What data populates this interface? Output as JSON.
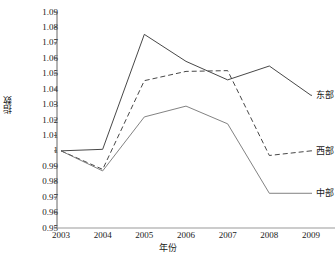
{
  "chart_data": {
    "type": "line",
    "title": "",
    "xlabel": "年份",
    "ylabel": "指数",
    "x": [
      2003,
      2004,
      2005,
      2006,
      2007,
      2008,
      2009
    ],
    "xtick_labels": [
      "2003",
      "2004",
      "2005",
      "2006",
      "2007",
      "2008",
      "2009"
    ],
    "ytick_labels": [
      "1.09",
      "1.08",
      "1.07",
      "1.06",
      "1.05",
      "1.04",
      "1.03",
      "1.02",
      "1.01",
      "1",
      "0.99",
      "0.98",
      "0.97",
      "0.96",
      "0.95"
    ],
    "ytick_values": [
      1.09,
      1.08,
      1.07,
      1.06,
      1.05,
      1.04,
      1.03,
      1.02,
      1.01,
      1.0,
      0.99,
      0.98,
      0.97,
      0.96,
      0.95
    ],
    "ylim": [
      0.95,
      1.09
    ],
    "xlim": [
      2003,
      2009
    ],
    "grid": false,
    "legend_position": "right-inline",
    "series": [
      {
        "name": "东部",
        "style": "solid",
        "color": "#3d3d3d",
        "values": [
          1.0,
          1.001,
          1.0755,
          1.058,
          1.046,
          1.055,
          1.036
        ]
      },
      {
        "name": "西部",
        "style": "dashed",
        "color": "#3d3d3d",
        "values": [
          1.0,
          0.988,
          1.0455,
          1.0515,
          1.052,
          0.997,
          1.0
        ]
      },
      {
        "name": "中部",
        "style": "solid",
        "color": "#6b6b6b",
        "values": [
          1.0,
          0.987,
          1.022,
          1.029,
          1.0175,
          0.9725,
          0.9725
        ]
      }
    ]
  },
  "axis": {
    "y_label": "指数",
    "x_label": "年份"
  },
  "legend": {
    "items": [
      {
        "label": "东部"
      },
      {
        "label": "西部"
      },
      {
        "label": "中部"
      }
    ]
  }
}
